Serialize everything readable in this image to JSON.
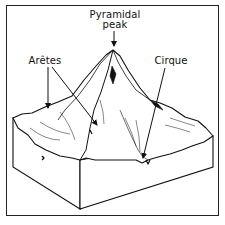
{
  "diagram": {
    "labels": {
      "pyramidal_peak_line1": "Pyramidal",
      "pyramidal_peak_line2": "peak",
      "aretes": "Arêtes",
      "cirque": "Cirque"
    },
    "colors": {
      "ink": "#111111",
      "background": "#ffffff",
      "frame": "#222222"
    },
    "arrows": [
      {
        "label": "Pyramidal peak",
        "from": [
          114,
          31
        ],
        "to": [
          114,
          46
        ]
      },
      {
        "label": "Arêtes",
        "from": [
          48,
          67
        ],
        "to": [
          48,
          108
        ]
      },
      {
        "label": "Arêtes",
        "from": [
          52,
          67
        ],
        "to": [
          97,
          125
        ]
      },
      {
        "label": "Cirque",
        "from": [
          165,
          68
        ],
        "to": [
          143,
          158
        ]
      }
    ]
  }
}
